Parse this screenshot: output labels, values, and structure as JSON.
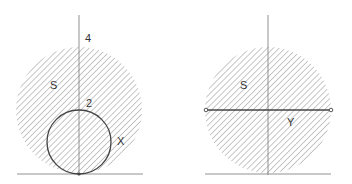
{
  "diagram": {
    "colors": {
      "line": "#444444",
      "hatch": "#9a9a9a",
      "axis": "#777777",
      "background": "#ffffff"
    },
    "left_panel": {
      "labels": {
        "top_tick": "4",
        "region": "S",
        "small_tick": "2",
        "inner_set": "X"
      },
      "big_circle": {
        "cx": 79,
        "cy": 110,
        "r": 63
      },
      "small_circle": {
        "cx": 79,
        "cy": 142,
        "r": 32
      }
    },
    "right_panel": {
      "labels": {
        "region": "S",
        "segment": "Y"
      },
      "big_circle": {
        "cx": 268,
        "cy": 110,
        "r": 63
      },
      "segment": {
        "x1": 206,
        "x2": 331,
        "y": 110
      }
    }
  }
}
